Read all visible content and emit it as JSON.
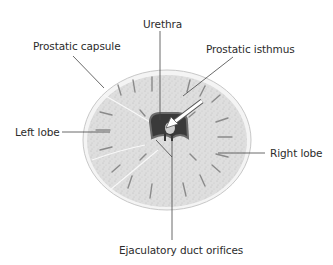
{
  "diagram": {
    "labels": {
      "urethra": "Urethra",
      "prostatic_capsule": "Prostatic capsule",
      "prostatic_isthmus": "Prostatic isthmus",
      "left_lobe": "Left lobe",
      "right_lobe": "Right lobe",
      "ejaculatory_duct_orifices": "Ejaculatory duct orifices"
    },
    "colors": {
      "tissue": "#dcdcdc",
      "capsule": "#f2f2f2",
      "urethra_lumen": "#3a3a3a",
      "leader_line": "#444444"
    }
  }
}
